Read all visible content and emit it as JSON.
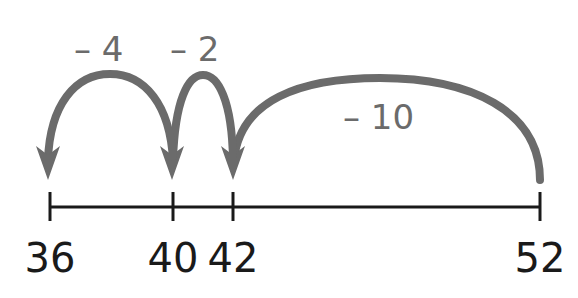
{
  "diagram": {
    "type": "number-line-subtraction",
    "start": 52,
    "end": 36,
    "number_line": {
      "ticks": [
        {
          "value": 36,
          "label": "36"
        },
        {
          "value": 40,
          "label": "40"
        },
        {
          "value": 42,
          "label": "42"
        },
        {
          "value": 52,
          "label": "52"
        }
      ]
    },
    "jumps": [
      {
        "from": 52,
        "to": 42,
        "label": "– 10"
      },
      {
        "from": 42,
        "to": 40,
        "label": "– 2"
      },
      {
        "from": 40,
        "to": 36,
        "label": "– 4"
      }
    ],
    "colors": {
      "arc": "#6b6b6b",
      "line": "#1a1a1a",
      "text": "#1a1a1a",
      "jump_text": "#6b6b6b"
    }
  }
}
